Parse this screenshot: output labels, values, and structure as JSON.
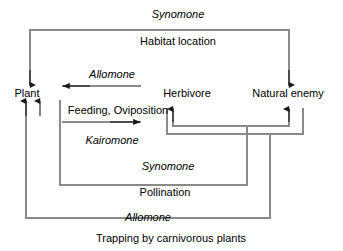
{
  "diagram": {
    "type": "flow-diagram",
    "caption": "Trapping by carnivorous plants",
    "line_color": "#8a8a8a",
    "text_color": "#000000",
    "nodes": [
      {
        "id": "plant",
        "label": "Plant",
        "x": 27,
        "y": 93
      },
      {
        "id": "herbivore",
        "label": "Herbivore",
        "x": 187,
        "y": 93
      },
      {
        "id": "natural_enemy",
        "label": "Natural enemy",
        "x": 288,
        "y": 93
      }
    ],
    "edge_labels": [
      {
        "id": "synomone_top",
        "label": "Synomone",
        "italic": true,
        "x": 178,
        "y": 14
      },
      {
        "id": "habitat_location",
        "label": "Habitat location",
        "italic": false,
        "x": 178,
        "y": 41
      },
      {
        "id": "allomone_mid",
        "label": "Allomone",
        "italic": true,
        "x": 112,
        "y": 74
      },
      {
        "id": "feeding_oviposition",
        "label": "Feeding, Oviposition",
        "italic": false,
        "x": 118,
        "y": 110
      },
      {
        "id": "kairomone",
        "label": "Kairomone",
        "italic": true,
        "x": 112,
        "y": 140
      },
      {
        "id": "synomone_lower",
        "label": "Synomone",
        "italic": true,
        "x": 168,
        "y": 166
      },
      {
        "id": "pollination",
        "label": "Pollination",
        "italic": false,
        "x": 165,
        "y": 192
      },
      {
        "id": "allomone_bottom",
        "label": "Allomone",
        "italic": true,
        "x": 148,
        "y": 217
      }
    ],
    "caption_position": {
      "x": 171,
      "y": 238
    }
  }
}
